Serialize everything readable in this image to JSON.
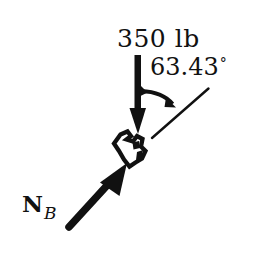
{
  "figure": {
    "type": "free-body-diagram",
    "background_color": "#ffffff",
    "ink_color": "#111111",
    "width": 265,
    "height": 253
  },
  "labels": {
    "applied_force": "350 lb",
    "angle_value": "63.43",
    "degree_symbol": "°",
    "reaction_symbol": "N",
    "reaction_subscript": "B"
  },
  "vectors": [
    {
      "name": "applied-load-arrow",
      "label": "350 lb",
      "direction": "down",
      "magnitude_text": "350 lb",
      "units": "lb",
      "value": 350,
      "tail": [
        138,
        55
      ],
      "tip": [
        138,
        133
      ]
    },
    {
      "name": "reaction-force-arrow",
      "label": "N_B",
      "direction": "up-right",
      "tail": [
        68,
        228
      ],
      "tip": [
        124,
        166
      ]
    }
  ],
  "angle_annotation": {
    "name": "angle-arc",
    "value_text": "63.43°",
    "between": [
      "applied-load-arrow",
      "incline-reference-line"
    ],
    "arc_start": [
      141,
      92
    ],
    "arc_end": [
      172,
      105
    ],
    "vertex": [
      138,
      88
    ]
  },
  "reference_line": {
    "name": "incline-reference-line",
    "start": [
      152,
      138
    ],
    "end": [
      208,
      89
    ]
  },
  "support": {
    "name": "pin-clevis-support",
    "position": [
      127,
      150
    ]
  }
}
